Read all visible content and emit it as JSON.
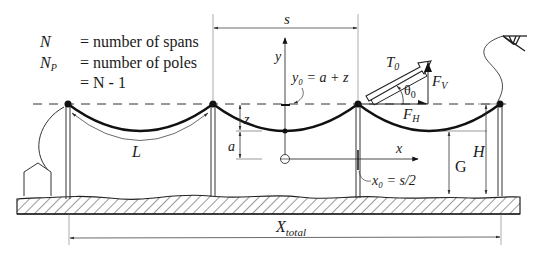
{
  "legend": {
    "rows": [
      {
        "symbol": "N",
        "symbol_sub": "",
        "text": "= number of spans"
      },
      {
        "symbol": "N",
        "symbol_sub": "P",
        "text": "= number of poles"
      },
      {
        "symbol": "",
        "symbol_sub": "",
        "text": "= N - 1"
      }
    ]
  },
  "labels": {
    "span": "s",
    "y_axis": "y",
    "y0_eq": "y₀ = a + z",
    "tension": "T",
    "tension_sub": "0",
    "theta": "θ",
    "theta_sub": "0",
    "fv": "F",
    "fv_sub": "V",
    "fh": "F",
    "fh_sub": "H",
    "z": "z",
    "a": "a",
    "x_axis": "x",
    "length": "L",
    "x0_eq": "x₀ = s/2",
    "ground_clearance": "G",
    "pole_height": "H",
    "total": "X",
    "total_sub": "total"
  },
  "colors": {
    "ink": "#1a1a1a",
    "thin": "#444444",
    "background": "#ffffff"
  }
}
